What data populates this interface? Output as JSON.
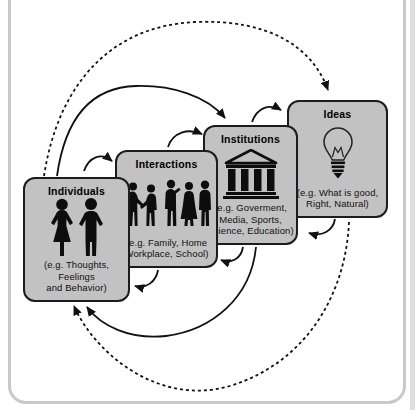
{
  "page": {
    "cropped_caption": "society as individuals, interactions, institutions and ideas.",
    "colors": {
      "box_fill": "#c2c2c2",
      "box_border": "#1c1c1c",
      "line": "#111111",
      "panel_border": "#c9c9c9"
    }
  },
  "diagram": {
    "boxes": [
      {
        "id": "individuals",
        "title": "Individuals",
        "icon": "two-people-silhouettes",
        "caption_lines": [
          "(e.g. Thoughts, Feelings",
          "and Behavior)"
        ]
      },
      {
        "id": "interactions",
        "title": "Interactions",
        "icon": "people-talking-silhouettes",
        "caption_lines": [
          "(e.g. Family, Home",
          "Workplace, School)"
        ]
      },
      {
        "id": "institutions",
        "title": "Institutions",
        "icon": "classical-building",
        "caption_lines": [
          "(e.g. Goverment,",
          "Media, Sports,",
          "Science, Education)"
        ]
      },
      {
        "id": "ideas",
        "title": "Ideas",
        "icon": "light-bulb",
        "caption_lines": [
          "(e.g. What is good,",
          "Right, Natural)"
        ]
      }
    ],
    "arrows": [
      {
        "from": "Individuals",
        "to": "Interactions",
        "style": "solid",
        "edge": "top"
      },
      {
        "from": "Interactions",
        "to": "Institutions",
        "style": "solid",
        "edge": "top"
      },
      {
        "from": "Institutions",
        "to": "Ideas",
        "style": "solid",
        "edge": "top"
      },
      {
        "from": "Individuals",
        "to": "Institutions",
        "style": "solid",
        "edge": "top-arc"
      },
      {
        "from": "Individuals",
        "to": "Ideas",
        "style": "dashed",
        "edge": "top-arc"
      },
      {
        "from": "Ideas",
        "to": "Institutions",
        "style": "solid",
        "edge": "bottom"
      },
      {
        "from": "Institutions",
        "to": "Interactions",
        "style": "solid",
        "edge": "bottom"
      },
      {
        "from": "Interactions",
        "to": "Individuals",
        "style": "solid",
        "edge": "bottom"
      },
      {
        "from": "Institutions",
        "to": "Individuals",
        "style": "solid",
        "edge": "bottom-arc"
      },
      {
        "from": "Ideas",
        "to": "Individuals",
        "style": "dashed",
        "edge": "bottom-arc"
      }
    ]
  }
}
